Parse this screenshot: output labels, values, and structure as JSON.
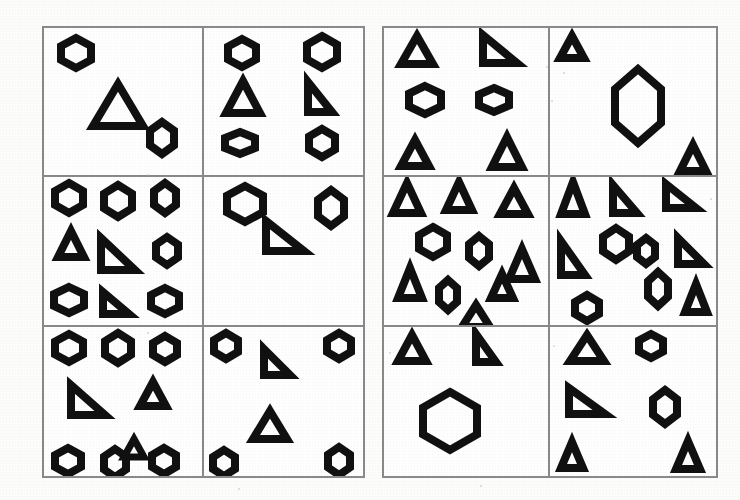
{
  "figure": {
    "background_color": "#ffffff",
    "stroke_color": "#111111",
    "border_color": "#8a8a8a"
  },
  "panels": [
    {
      "id": "left-panel",
      "label": "Left panel",
      "x": 42,
      "y": 26,
      "width": 323,
      "height": 452,
      "cells": [
        {
          "id": "L1",
          "label": "left-cell-row1-col1",
          "shape_count": 3,
          "shapes": [
            {
              "kind": "hexagon",
              "cx": 20,
              "cy": 17,
              "w": 30,
              "h": 30,
              "stroke": 8,
              "rot": 0
            },
            {
              "kind": "triangle",
              "cx": 47,
              "cy": 52,
              "w": 50,
              "h": 42,
              "stroke": 8,
              "rot": 0
            },
            {
              "kind": "hexagon",
              "cx": 75,
              "cy": 75,
              "w": 24,
              "h": 32,
              "stroke": 8,
              "rot": 0
            }
          ]
        },
        {
          "id": "L2",
          "label": "left-cell-row1-col2",
          "shape_count": 6,
          "shapes": [
            {
              "kind": "hexagon",
              "cx": 24,
              "cy": 17,
              "w": 28,
              "h": 28,
              "stroke": 8,
              "rot": 0
            },
            {
              "kind": "hexagon",
              "cx": 74,
              "cy": 16,
              "w": 30,
              "h": 32,
              "stroke": 8,
              "rot": 0
            },
            {
              "kind": "triangle",
              "cx": 25,
              "cy": 47,
              "w": 34,
              "h": 32,
              "stroke": 8,
              "rot": 0
            },
            {
              "kind": "righttri",
              "cx": 73,
              "cy": 47,
              "w": 24,
              "h": 30,
              "stroke": 8,
              "rot": 0
            },
            {
              "kind": "hexagon",
              "cx": 23,
              "cy": 78,
              "w": 30,
              "h": 22,
              "stroke": 8,
              "rot": 0
            },
            {
              "kind": "hexagon",
              "cx": 74,
              "cy": 78,
              "w": 26,
              "h": 28,
              "stroke": 8,
              "rot": 0
            }
          ]
        },
        {
          "id": "L3",
          "label": "left-cell-row2-col1",
          "shape_count": 9,
          "shapes": [
            {
              "kind": "hexagon",
              "cx": 16,
              "cy": 14,
              "w": 28,
              "h": 30,
              "stroke": 8,
              "rot": 0
            },
            {
              "kind": "hexagon",
              "cx": 47,
              "cy": 16,
              "w": 28,
              "h": 32,
              "stroke": 8,
              "rot": 0
            },
            {
              "kind": "hexagon",
              "cx": 77,
              "cy": 14,
              "w": 22,
              "h": 30,
              "stroke": 8,
              "rot": 0
            },
            {
              "kind": "triangle",
              "cx": 17,
              "cy": 45,
              "w": 26,
              "h": 26,
              "stroke": 8,
              "rot": 0
            },
            {
              "kind": "righttri",
              "cx": 47,
              "cy": 52,
              "w": 34,
              "h": 32,
              "stroke": 8,
              "rot": 0
            },
            {
              "kind": "hexagon",
              "cx": 78,
              "cy": 50,
              "w": 22,
              "h": 28,
              "stroke": 8,
              "rot": 0
            },
            {
              "kind": "hexagon",
              "cx": 16,
              "cy": 83,
              "w": 30,
              "h": 26,
              "stroke": 8,
              "rot": 0
            },
            {
              "kind": "righttri",
              "cx": 46,
              "cy": 85,
              "w": 26,
              "h": 22,
              "stroke": 8,
              "rot": 0
            },
            {
              "kind": "hexagon",
              "cx": 77,
              "cy": 84,
              "w": 28,
              "h": 26,
              "stroke": 8,
              "rot": 0
            }
          ]
        },
        {
          "id": "L4",
          "label": "left-cell-row2-col2",
          "shape_count": 3,
          "shapes": [
            {
              "kind": "hexagon",
              "cx": 26,
              "cy": 18,
              "w": 36,
              "h": 36,
              "stroke": 8,
              "rot": 0
            },
            {
              "kind": "hexagon",
              "cx": 80,
              "cy": 21,
              "w": 26,
              "h": 36,
              "stroke": 8,
              "rot": 0
            },
            {
              "kind": "righttri",
              "cx": 51,
              "cy": 40,
              "w": 38,
              "h": 30,
              "stroke": 8,
              "rot": 0
            }
          ]
        },
        {
          "id": "L5",
          "label": "left-cell-row3-col1",
          "shape_count": 8,
          "shapes": [
            {
              "kind": "hexagon",
              "cx": 16,
              "cy": 14,
              "w": 28,
              "h": 28,
              "stroke": 8,
              "rot": 0
            },
            {
              "kind": "hexagon",
              "cx": 47,
              "cy": 14,
              "w": 26,
              "h": 30,
              "stroke": 8,
              "rot": 0
            },
            {
              "kind": "hexagon",
              "cx": 77,
              "cy": 15,
              "w": 24,
              "h": 26,
              "stroke": 8,
              "rot": 0
            },
            {
              "kind": "righttri",
              "cx": 28,
              "cy": 49,
              "w": 34,
              "h": 30,
              "stroke": 8,
              "rot": 0
            },
            {
              "kind": "triangle",
              "cx": 69,
              "cy": 45,
              "w": 26,
              "h": 24,
              "stroke": 8,
              "rot": 0
            },
            {
              "kind": "triangle",
              "cx": 57,
              "cy": 81,
              "w": 20,
              "h": 18,
              "stroke": 7,
              "rot": 0
            },
            {
              "kind": "hexagon",
              "cx": 15,
              "cy": 90,
              "w": 26,
              "h": 26,
              "stroke": 8,
              "rot": 0
            },
            {
              "kind": "hexagon",
              "cx": 45,
              "cy": 91,
              "w": 22,
              "h": 28,
              "stroke": 8,
              "rot": 0
            },
            {
              "kind": "hexagon",
              "cx": 76,
              "cy": 90,
              "w": 24,
              "h": 26,
              "stroke": 8,
              "rot": 0
            }
          ]
        },
        {
          "id": "L6",
          "label": "left-cell-row3-col2",
          "shape_count": 6,
          "shapes": [
            {
              "kind": "hexagon",
              "cx": 14,
              "cy": 13,
              "w": 24,
              "h": 26,
              "stroke": 8,
              "rot": 0
            },
            {
              "kind": "hexagon",
              "cx": 85,
              "cy": 13,
              "w": 24,
              "h": 26,
              "stroke": 8,
              "rot": 0
            },
            {
              "kind": "righttri",
              "cx": 46,
              "cy": 24,
              "w": 26,
              "h": 26,
              "stroke": 8,
              "rot": 0
            },
            {
              "kind": "triangle",
              "cx": 42,
              "cy": 66,
              "w": 34,
              "h": 28,
              "stroke": 8,
              "rot": 0
            },
            {
              "kind": "hexagon",
              "cx": 13,
              "cy": 91,
              "w": 22,
              "h": 26,
              "stroke": 8,
              "rot": 0
            },
            {
              "kind": "hexagon",
              "cx": 85,
              "cy": 90,
              "w": 22,
              "h": 28,
              "stroke": 8,
              "rot": 0
            }
          ]
        }
      ]
    },
    {
      "id": "right-panel",
      "label": "Right panel",
      "x": 382,
      "y": 26,
      "width": 336,
      "height": 452,
      "cells": [
        {
          "id": "R1",
          "label": "right-cell-row1-col1",
          "shape_count": 6,
          "shapes": [
            {
              "kind": "triangle",
              "cx": 20,
              "cy": 15,
              "w": 32,
              "h": 28,
              "stroke": 8,
              "rot": 0
            },
            {
              "kind": "righttri",
              "cx": 71,
              "cy": 14,
              "w": 34,
              "h": 28,
              "stroke": 8,
              "rot": 0
            },
            {
              "kind": "hexagon",
              "cx": 25,
              "cy": 49,
              "w": 32,
              "h": 28,
              "stroke": 8,
              "rot": 0
            },
            {
              "kind": "hexagon",
              "cx": 67,
              "cy": 49,
              "w": 30,
              "h": 24,
              "stroke": 8,
              "rot": 0
            },
            {
              "kind": "triangle",
              "cx": 19,
              "cy": 85,
              "w": 28,
              "h": 26,
              "stroke": 8,
              "rot": 0
            },
            {
              "kind": "triangle",
              "cx": 75,
              "cy": 84,
              "w": 30,
              "h": 30,
              "stroke": 8,
              "rot": 0
            }
          ]
        },
        {
          "id": "R2",
          "label": "right-cell-row1-col2",
          "shape_count": 3,
          "shapes": [
            {
              "kind": "triangle",
              "cx": 13,
              "cy": 13,
              "w": 24,
              "h": 22,
              "stroke": 8,
              "rot": 0
            },
            {
              "kind": "hexagon",
              "cx": 53,
              "cy": 53,
              "w": 46,
              "h": 74,
              "stroke": 8,
              "rot": 0
            },
            {
              "kind": "triangle",
              "cx": 86,
              "cy": 88,
              "w": 26,
              "h": 26,
              "stroke": 8,
              "rot": 0
            }
          ]
        },
        {
          "id": "R3",
          "label": "right-cell-row2-col1",
          "shape_count": 10,
          "shapes": [
            {
              "kind": "triangle",
              "cx": 14,
              "cy": 14,
              "w": 28,
              "h": 30,
              "stroke": 8,
              "rot": 0
            },
            {
              "kind": "triangle",
              "cx": 46,
              "cy": 13,
              "w": 26,
              "h": 28,
              "stroke": 8,
              "rot": 0
            },
            {
              "kind": "triangle",
              "cx": 79,
              "cy": 16,
              "w": 28,
              "h": 26,
              "stroke": 8,
              "rot": 0
            },
            {
              "kind": "hexagon",
              "cx": 30,
              "cy": 44,
              "w": 28,
              "h": 30,
              "stroke": 8,
              "rot": 0
            },
            {
              "kind": "hexagon",
              "cx": 58,
              "cy": 50,
              "w": 20,
              "h": 30,
              "stroke": 8,
              "rot": 0
            },
            {
              "kind": "triangle",
              "cx": 16,
              "cy": 72,
              "w": 24,
              "h": 30,
              "stroke": 8,
              "rot": 0
            },
            {
              "kind": "triangle",
              "cx": 84,
              "cy": 59,
              "w": 26,
              "h": 30,
              "stroke": 8,
              "rot": 0
            },
            {
              "kind": "hexagon",
              "cx": 39,
              "cy": 80,
              "w": 18,
              "h": 30,
              "stroke": 8,
              "rot": 0
            },
            {
              "kind": "triangle",
              "cx": 72,
              "cy": 74,
              "w": 22,
              "h": 24,
              "stroke": 8,
              "rot": 0
            },
            {
              "kind": "triangle",
              "cx": 56,
              "cy": 94,
              "w": 28,
              "h": 22,
              "stroke": 8,
              "rot": 0
            }
          ]
        },
        {
          "id": "R4",
          "label": "right-cell-row2-col2",
          "shape_count": 10,
          "shapes": [
            {
              "kind": "triangle",
              "cx": 14,
              "cy": 14,
              "w": 24,
              "h": 32,
              "stroke": 8,
              "rot": 0
            },
            {
              "kind": "righttri",
              "cx": 45,
              "cy": 15,
              "w": 24,
              "h": 28,
              "stroke": 8,
              "rot": 0
            },
            {
              "kind": "righttri",
              "cx": 79,
              "cy": 13,
              "w": 30,
              "h": 24,
              "stroke": 8,
              "rot": 0
            },
            {
              "kind": "hexagon",
              "cx": 40,
              "cy": 45,
              "w": 26,
              "h": 32,
              "stroke": 8,
              "rot": 0
            },
            {
              "kind": "righttri",
              "cx": 14,
              "cy": 55,
              "w": 24,
              "h": 34,
              "stroke": 8,
              "rot": 0
            },
            {
              "kind": "hexagon",
              "cx": 58,
              "cy": 50,
              "w": 18,
              "h": 26,
              "stroke": 8,
              "rot": 0
            },
            {
              "kind": "righttri",
              "cx": 85,
              "cy": 50,
              "w": 26,
              "h": 26,
              "stroke": 8,
              "rot": 0
            },
            {
              "kind": "hexagon",
              "cx": 65,
              "cy": 76,
              "w": 20,
              "h": 34,
              "stroke": 8,
              "rot": 0
            },
            {
              "kind": "hexagon",
              "cx": 22,
              "cy": 89,
              "w": 24,
              "h": 26,
              "stroke": 8,
              "rot": 0
            },
            {
              "kind": "triangle",
              "cx": 88,
              "cy": 82,
              "w": 22,
              "h": 28,
              "stroke": 8,
              "rot": 0
            }
          ]
        },
        {
          "id": "R5",
          "label": "right-cell-row3-col1",
          "shape_count": 3,
          "shapes": [
            {
              "kind": "triangle",
              "cx": 17,
              "cy": 14,
              "w": 28,
              "h": 26,
              "stroke": 8,
              "rot": 0
            },
            {
              "kind": "righttri",
              "cx": 62,
              "cy": 14,
              "w": 20,
              "h": 28,
              "stroke": 8,
              "rot": 0
            },
            {
              "kind": "hexagon",
              "cx": 40,
              "cy": 63,
              "w": 54,
              "h": 58,
              "stroke": 8,
              "rot": 0
            }
          ]
        },
        {
          "id": "R6",
          "label": "right-cell-row3-col2",
          "shape_count": 6,
          "shapes": [
            {
              "kind": "triangle",
              "cx": 22,
              "cy": 14,
              "w": 34,
              "h": 26,
              "stroke": 8,
              "rot": 0
            },
            {
              "kind": "hexagon",
              "cx": 61,
              "cy": 13,
              "w": 24,
              "h": 24,
              "stroke": 8,
              "rot": 0
            },
            {
              "kind": "righttri",
              "cx": 22,
              "cy": 50,
              "w": 36,
              "h": 26,
              "stroke": 8,
              "rot": 0
            },
            {
              "kind": "hexagon",
              "cx": 69,
              "cy": 54,
              "w": 24,
              "h": 34,
              "stroke": 8,
              "rot": 0
            },
            {
              "kind": "triangle",
              "cx": 13,
              "cy": 86,
              "w": 22,
              "h": 26,
              "stroke": 8,
              "rot": 0
            },
            {
              "kind": "triangle",
              "cx": 83,
              "cy": 86,
              "w": 24,
              "h": 28,
              "stroke": 8,
              "rot": 0
            }
          ]
        }
      ]
    }
  ],
  "specks": [
    {
      "x": 546,
      "y": 66,
      "d": 2
    },
    {
      "x": 551,
      "y": 100,
      "d": 2
    },
    {
      "x": 563,
      "y": 72,
      "d": 2
    },
    {
      "x": 389,
      "y": 352,
      "d": 2
    },
    {
      "x": 553,
      "y": 345,
      "d": 2
    },
    {
      "x": 480,
      "y": 485,
      "d": 2
    },
    {
      "x": 238,
      "y": 488,
      "d": 2
    },
    {
      "x": 147,
      "y": 332,
      "d": 2
    },
    {
      "x": 147,
      "y": 174,
      "d": 2
    },
    {
      "x": 710,
      "y": 198,
      "d": 2
    }
  ]
}
